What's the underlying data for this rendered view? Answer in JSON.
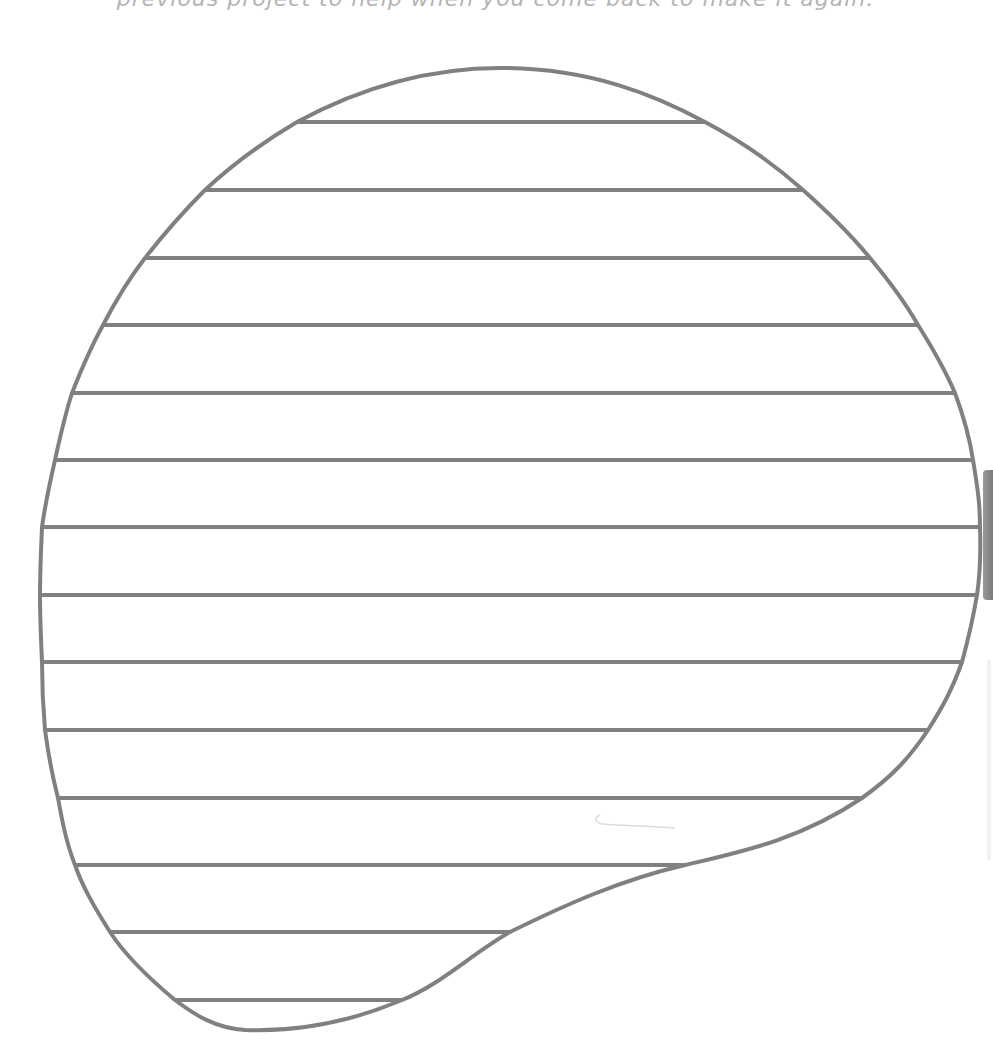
{
  "caption": {
    "text": "previous project to help when you come back to make it again."
  },
  "shape": {
    "kind": "lined-blob-writing-area",
    "stroke_color": "#808080",
    "fill_color": "#ffffff",
    "line_count": 14,
    "line_y_positions": [
      122,
      190,
      258,
      325,
      393,
      460,
      527,
      595,
      662,
      730,
      798,
      865,
      932,
      1000
    ]
  }
}
